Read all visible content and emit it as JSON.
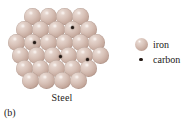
{
  "figure": {
    "panel_label": "(b)",
    "structure_label": "Steel"
  },
  "legend": {
    "items": [
      {
        "icon": "iron-sphere-icon",
        "label": "iron",
        "color": "#d8c2b8"
      },
      {
        "icon": "carbon-dot-icon",
        "label": "carbon",
        "color": "#241a15"
      }
    ]
  },
  "diagram": {
    "type": "crystal-lattice",
    "sphere_color": "#d8c2b8",
    "sphere_shadow_color": "#a08074",
    "sphere_highlight_color": "#ece0da",
    "carbon_color": "#241a15",
    "sphere_diameter_px": 17,
    "carbon_diameter_px": 3.4,
    "rows": [
      {
        "y": 8,
        "xs": [
          24,
          40,
          56,
          72
        ]
      },
      {
        "y": 21,
        "xs": [
          16,
          32,
          48,
          64,
          80
        ]
      },
      {
        "y": 34,
        "xs": [
          8,
          24,
          40,
          56,
          72,
          88
        ]
      },
      {
        "y": 47,
        "xs": [
          12,
          28,
          44,
          60,
          76,
          92
        ]
      },
      {
        "y": 60,
        "xs": [
          16,
          32,
          48,
          64,
          80
        ]
      },
      {
        "y": 72,
        "xs": [
          22,
          38,
          54,
          70
        ]
      }
    ],
    "carbon_atoms": [
      {
        "x": 71,
        "y": 26
      },
      {
        "x": 33,
        "y": 41
      },
      {
        "x": 59,
        "y": 55
      },
      {
        "x": 86,
        "y": 58
      }
    ]
  }
}
